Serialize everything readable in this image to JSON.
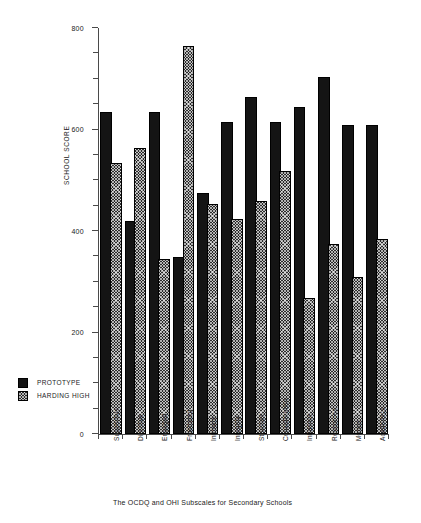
{
  "chart_data": {
    "type": "bar",
    "title": "",
    "caption": "The OCDQ and OHI Subscales for Secondary Schools",
    "xlabel": "",
    "ylabel": "SCHOOL SCORE",
    "ylim": [
      0,
      800
    ],
    "yticks": [
      0,
      200,
      400,
      600,
      800
    ],
    "ytick_labels": [
      "0",
      "200",
      "400",
      "600",
      "800"
    ],
    "minor_tick_step": 50,
    "grid": false,
    "legend_position": "lower-left-outside",
    "categories": [
      "Supportive",
      "Directive",
      "Engaged",
      "Frustrated",
      "Intimate",
      "Integrity",
      "Structure",
      "Consideration",
      "Influence",
      "Resources",
      "Morale",
      "Academics"
    ],
    "series": [
      {
        "name": "PROTOTYPE",
        "fill": "solid-black",
        "color": "#141414",
        "values": [
          630,
          415,
          630,
          345,
          470,
          610,
          660,
          610,
          640,
          700,
          605,
          605
        ]
      },
      {
        "name": "HARDING HIGH",
        "fill": "cross-hatch",
        "color": "#2b2b2b",
        "values": [
          530,
          560,
          340,
          760,
          450,
          420,
          455,
          515,
          265,
          370,
          305,
          380
        ]
      }
    ]
  },
  "legend": {
    "items": [
      {
        "label": "PROTOTYPE",
        "swatch": "solid-black"
      },
      {
        "label": "HARDING HIGH",
        "swatch": "cross-hatch"
      }
    ]
  }
}
